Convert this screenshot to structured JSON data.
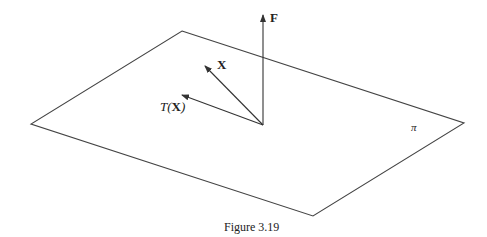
{
  "figure": {
    "caption": "Figure 3.19",
    "plane_label": "π",
    "vectors": {
      "F": {
        "label": "F"
      },
      "X": {
        "label": "X"
      },
      "TX": {
        "label_prefix": "T",
        "label_open": "(",
        "label_arg": "X",
        "label_close": ")"
      }
    }
  }
}
